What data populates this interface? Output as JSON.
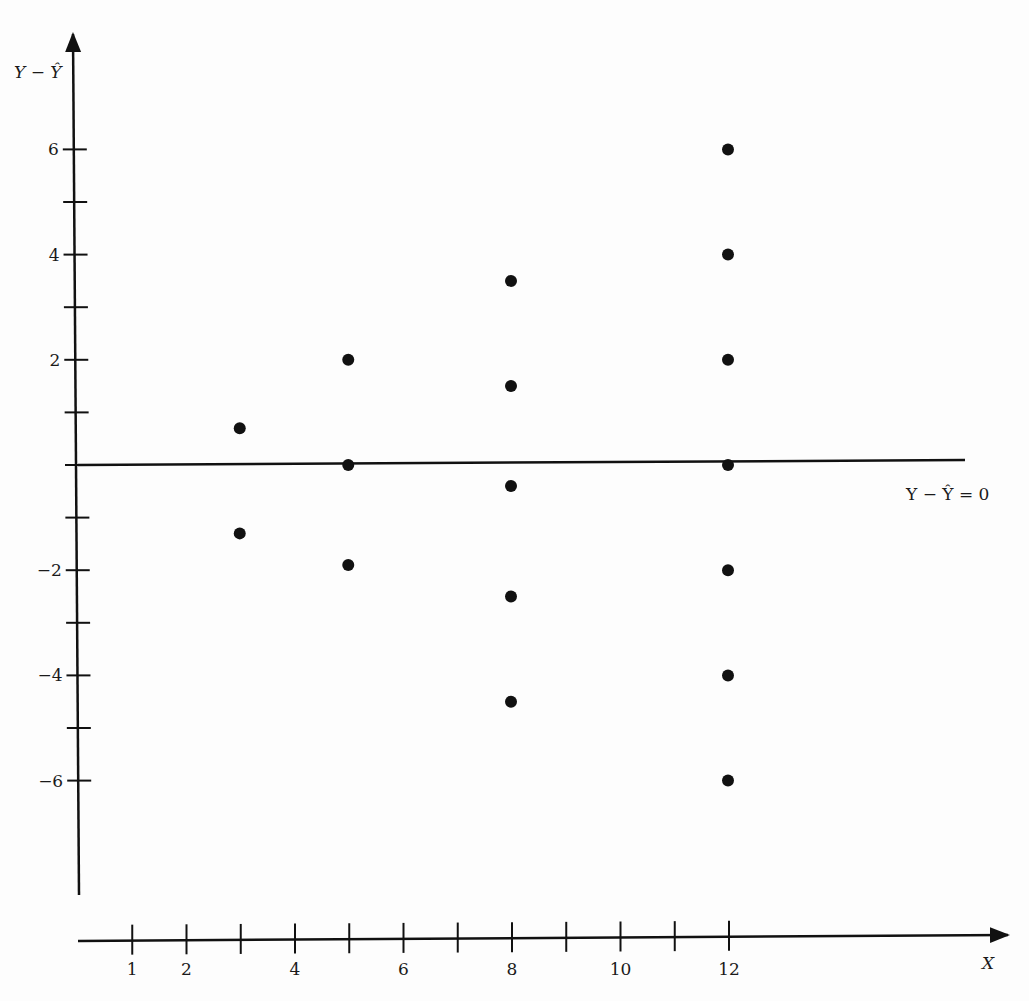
{
  "chart_data": {
    "type": "scatter",
    "title": "",
    "xlabel": "X",
    "ylabel": "Y − Ŷ",
    "reference_line": {
      "y": 0,
      "label": "Y − Ŷ = 0"
    },
    "xlim": [
      0,
      16
    ],
    "ylim": [
      -8,
      8
    ],
    "x_ticks": [
      1,
      2,
      3,
      4,
      5,
      6,
      7,
      8,
      9,
      10,
      11,
      12
    ],
    "x_tick_labels": [
      "1",
      "2",
      "",
      "4",
      "",
      "6",
      "",
      "8",
      "",
      "10",
      "",
      "12"
    ],
    "y_ticks": [
      6,
      5,
      4,
      3,
      2,
      1,
      0,
      -1,
      -2,
      -3,
      -4,
      -5,
      -6
    ],
    "y_tick_labels": [
      "6",
      "",
      "4",
      "",
      "2",
      "",
      "",
      "",
      "−2",
      "",
      "−4",
      "",
      "−6"
    ],
    "grid": false,
    "legend": null,
    "series": [
      {
        "name": "residuals",
        "points": [
          {
            "x": 3,
            "y": 0.7
          },
          {
            "x": 3,
            "y": -1.3
          },
          {
            "x": 5,
            "y": 2.0
          },
          {
            "x": 5,
            "y": 0.0
          },
          {
            "x": 5,
            "y": -1.9
          },
          {
            "x": 8,
            "y": 3.5
          },
          {
            "x": 8,
            "y": 1.5
          },
          {
            "x": 8,
            "y": -0.4
          },
          {
            "x": 8,
            "y": -2.5
          },
          {
            "x": 8,
            "y": -4.5
          },
          {
            "x": 12,
            "y": 6.0
          },
          {
            "x": 12,
            "y": 4.0
          },
          {
            "x": 12,
            "y": 2.0
          },
          {
            "x": 12,
            "y": 0.0
          },
          {
            "x": 12,
            "y": -2.0
          },
          {
            "x": 12,
            "y": -4.0
          },
          {
            "x": 12,
            "y": -6.0
          }
        ]
      }
    ]
  },
  "colors": {
    "ink": "#111111",
    "background": "#fdfdfd"
  }
}
